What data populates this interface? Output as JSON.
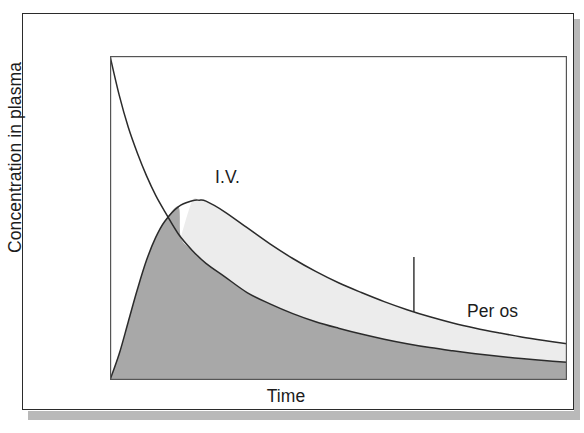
{
  "figure": {
    "axes": {
      "y_title": "Concentration in plasma",
      "x_title": "Time"
    },
    "annotations": {
      "iv_label": "I.V.",
      "peros_label": "Per os"
    }
  },
  "colors": {
    "curve_line": "#2b2b2b",
    "fill_iv_dark": "#a8a8a8",
    "fill_peros_light": "#ececec",
    "frame_border": "#2b2b2b",
    "plot_frame": "#555555",
    "shadow_band": "#b9b9b9",
    "background": "#ffffff",
    "text": "#1c1c1c"
  },
  "chart_data": {
    "type": "line",
    "title": "",
    "subtitle": "",
    "xlabel": "Time",
    "ylabel": "Concentration in plasma",
    "xlim": [
      0,
      100
    ],
    "ylim": [
      0,
      100
    ],
    "grid": false,
    "axis_ticks": false,
    "legend": "inline-annotations",
    "annotations": [
      {
        "text": "I.V.",
        "x": 16,
        "y": 82,
        "leader_line": false
      },
      {
        "text": "Per os",
        "x": 66,
        "y": 40,
        "leader_line": true,
        "leader_from": [
          66.5,
          38
        ],
        "leader_to": [
          66.5,
          21
        ]
      }
    ],
    "series": [
      {
        "name": "I.V.",
        "description": "Intravenous administration: maximum plasma concentration immediately at t=0, then mono-exponential decay. Area beneath this curve is filled dark grey.",
        "fill": "dark-grey",
        "fill_color": "#a8a8a8",
        "x": [
          0,
          2,
          4,
          6,
          8,
          10,
          12,
          15,
          18,
          21,
          25,
          30,
          35,
          40,
          45,
          50,
          55,
          60,
          65,
          70,
          75,
          80,
          85,
          90,
          95,
          100
        ],
        "y": [
          100,
          88,
          78,
          70,
          63,
          57,
          52,
          45,
          40,
          36,
          32,
          27,
          23.5,
          20.5,
          18,
          16,
          14.2,
          12.6,
          11.2,
          10,
          9,
          8.1,
          7.3,
          6.6,
          6.0,
          5.5
        ]
      },
      {
        "name": "Per os",
        "description": "Oral administration: absorption phase rises from zero to a delayed peak (Cmax at Tmax), then slower elimination. Remains above the I.V. curve after the crossover point. Band between the two curves is filled light grey.",
        "fill": "light-grey",
        "fill_color": "#ececec",
        "x": [
          0,
          2,
          4,
          6,
          8,
          10,
          12,
          15,
          18,
          19.5,
          21,
          25,
          30,
          35,
          40,
          45,
          50,
          55,
          60,
          65,
          70,
          75,
          80,
          85,
          90,
          95,
          100
        ],
        "y": [
          0,
          8,
          18,
          28,
          37,
          44,
          49,
          53.5,
          55.3,
          55.5,
          55.2,
          52,
          47,
          42,
          37.5,
          33.5,
          30,
          27,
          24.2,
          21.7,
          19.5,
          17.6,
          16,
          14.6,
          13.3,
          12.2,
          11.2
        ]
      }
    ],
    "crossover_point": {
      "x": 15.5,
      "y": 44,
      "note": "Point where the rising Per os curve intersects the falling I.V. curve"
    },
    "cmax_peros": {
      "x": 19.5,
      "y": 55.5,
      "note": "Tmax / Cmax of the oral (per os) profile"
    }
  }
}
